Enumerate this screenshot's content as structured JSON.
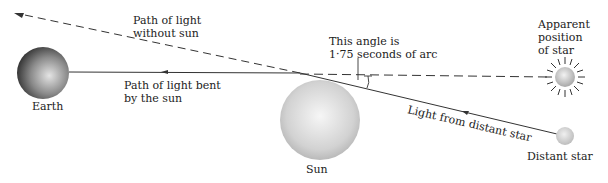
{
  "diagram": {
    "labels": {
      "path_without_sun_1": "Path of light",
      "path_without_sun_2": "without sun",
      "angle_1": "This angle is",
      "angle_2": "1·75 seconds of arc",
      "apparent_1": "Apparent",
      "apparent_2": "position",
      "apparent_3": "of star",
      "bent_1": "Path of light bent",
      "bent_2": "by the sun",
      "earth": "Earth",
      "sun": "Sun",
      "light_from": "Light from distant star",
      "distant_star": "Distant star"
    }
  }
}
